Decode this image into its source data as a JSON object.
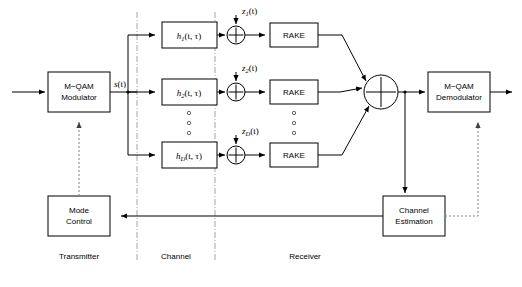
{
  "figure": {
    "type": "block-diagram",
    "background_color": "#ffffff",
    "line_color": "#000000",
    "dashed_line_color": "#808080",
    "divider_color": "#9a9a9a"
  },
  "sections": [
    {
      "id": "transmitter",
      "label": "Transmitter"
    },
    {
      "id": "channel",
      "label": "Channel"
    },
    {
      "id": "receiver",
      "label": "Receiver"
    }
  ],
  "blocks": [
    {
      "id": "modulator",
      "line1": "M−QAM",
      "line2": "Modulator"
    },
    {
      "id": "demodulator",
      "line1": "M−QAM",
      "line2": "Demodulator"
    },
    {
      "id": "mode_control",
      "line1": "Mode",
      "line2": "Control"
    },
    {
      "id": "channel_estimation",
      "line1": "Channel",
      "line2": "Estimation"
    },
    {
      "id": "rake1",
      "line1": "RAKE",
      "line2": ""
    },
    {
      "id": "rake2",
      "line1": "RAKE",
      "line2": ""
    },
    {
      "id": "rakeD",
      "line1": "RAKE",
      "line2": ""
    }
  ],
  "channel_taps": [
    {
      "id": "h1",
      "base": "h",
      "sub": "1",
      "args": "(t, τ)"
    },
    {
      "id": "h2",
      "base": "h",
      "sub": "2",
      "args": "(t, τ)"
    },
    {
      "id": "hD",
      "base": "h",
      "sub": "D",
      "args": "(t, τ)"
    }
  ],
  "noise_sources": [
    {
      "id": "z1",
      "base": "z",
      "sub": "1",
      "args": "(t)"
    },
    {
      "id": "z2",
      "base": "z",
      "sub": "2",
      "args": "(t)"
    },
    {
      "id": "zD",
      "base": "z",
      "sub": "D",
      "args": "(t)"
    }
  ],
  "signals": [
    {
      "id": "s_t",
      "base": "s",
      "sub": "",
      "args": "(t)"
    }
  ],
  "adders": [
    {
      "id": "adder1",
      "symbol": "plus"
    },
    {
      "id": "adder2",
      "symbol": "plus"
    },
    {
      "id": "adderD",
      "symbol": "plus"
    },
    {
      "id": "combiner",
      "symbol": "plus"
    }
  ],
  "ellipses": [
    {
      "id": "tap-ellipsis",
      "marker": "circle",
      "count": 3
    },
    {
      "id": "rake-ellipsis",
      "marker": "circle",
      "count": 3
    }
  ]
}
